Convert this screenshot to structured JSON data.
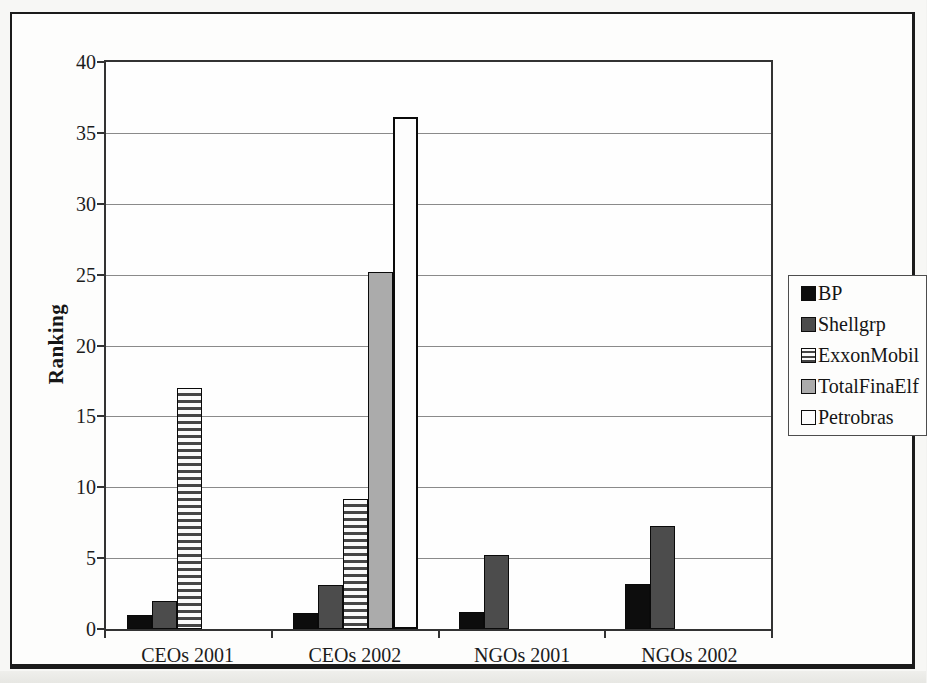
{
  "figure": {
    "background_color": "#f7f7f5",
    "frame_border_color": "#1b1b1b",
    "plot_background_color": "#fefefe",
    "gridline_color": "#8a8a8a",
    "axis_color": "#333333"
  },
  "chart_data": {
    "type": "bar",
    "title": "",
    "xlabel": "",
    "ylabel": "Ranking",
    "ylim": [
      0,
      40
    ],
    "ytick_step": 5,
    "yticks": [
      "0",
      "5",
      "10",
      "15",
      "20",
      "25",
      "30",
      "35",
      "40"
    ],
    "grid": true,
    "legend_position": "right",
    "categories": [
      "CEOs 2001",
      "CEOs 2002",
      "NGOs 2001",
      "NGOs 2002"
    ],
    "series": [
      {
        "name": "BP",
        "values": [
          1.0,
          1.1,
          1.2,
          3.2
        ],
        "pattern": "solid",
        "color": "#0d0d0d"
      },
      {
        "name": "Shellgrp",
        "values": [
          2.0,
          3.1,
          5.2,
          7.3
        ],
        "pattern": "solid",
        "color": "#4c4c4c"
      },
      {
        "name": "ExxonMobil",
        "values": [
          17.0,
          9.2,
          0,
          0
        ],
        "pattern": "hstripes",
        "stripe_light": "#fafafa",
        "stripe_dark": "#454545"
      },
      {
        "name": "TotalFinaElf",
        "values": [
          0,
          25.2,
          0,
          0
        ],
        "pattern": "solid",
        "color": "#ababab"
      },
      {
        "name": "Petrobras",
        "values": [
          0,
          36.1,
          0,
          0
        ],
        "pattern": "outline",
        "color": "#fdfdfd"
      }
    ]
  }
}
